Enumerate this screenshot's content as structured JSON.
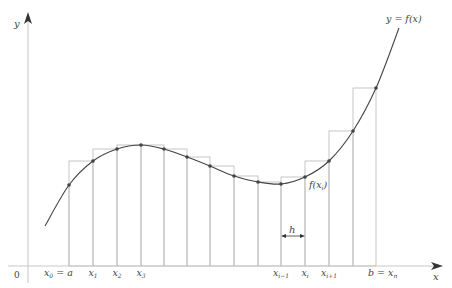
{
  "diagram": {
    "curve_label": "y = f(x)",
    "point_label": "f(x_i)",
    "step_label": "h",
    "origin_label": "0",
    "x_axis_label": "x",
    "y_axis_label": "y",
    "colors": {
      "curve": "#444444",
      "rect": "#b8b8b8",
      "axis": "#c8c8c8",
      "point": "#444444",
      "text": "#444444"
    }
  },
  "chart_data": {
    "type": "diagram",
    "x_ticks": [
      {
        "x": 69,
        "label": "x",
        "sub": "0",
        "suffix": " = a"
      },
      {
        "x": 93,
        "label": "x",
        "sub": "1"
      },
      {
        "x": 117,
        "label": "x",
        "sub": "2"
      },
      {
        "x": 141,
        "label": "x",
        "sub": "3"
      },
      {
        "x": 281,
        "label": "x",
        "sub": "i−1"
      },
      {
        "x": 305,
        "label": "x",
        "sub": "i"
      },
      {
        "x": 329,
        "label": "x",
        "sub": "i+1"
      },
      {
        "x": 376,
        "label": "b = x",
        "sub": "n"
      }
    ],
    "grid_x": [
      69,
      93,
      117,
      141,
      164,
      187,
      210,
      234,
      258,
      281,
      305,
      329,
      353,
      376
    ],
    "points": [
      [
        69,
        185
      ],
      [
        93,
        161
      ],
      [
        117,
        149
      ],
      [
        141,
        145
      ],
      [
        164,
        149
      ],
      [
        187,
        157
      ],
      [
        210,
        166
      ],
      [
        234,
        176
      ],
      [
        258,
        182
      ],
      [
        281,
        184
      ],
      [
        305,
        177
      ],
      [
        329,
        161
      ],
      [
        353,
        131
      ],
      [
        376,
        88
      ]
    ],
    "rect_tops": [
      161,
      149,
      145,
      145,
      149,
      157,
      166,
      176,
      182,
      177,
      161,
      131,
      88
    ],
    "curve_start": [
      45,
      226
    ],
    "curve_end": [
      399,
      28
    ],
    "x_axis_y": 266,
    "y_axis_x": 28
  }
}
